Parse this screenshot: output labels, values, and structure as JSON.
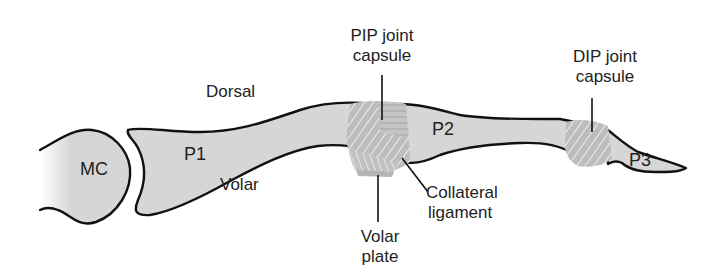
{
  "figure": {
    "colors": {
      "bone_fill": "#d6d6d6",
      "outline": "#111111",
      "ligament": "#bdbdbd",
      "ligament_stripe": "#eeeeee",
      "text": "#222222"
    }
  },
  "orientation": {
    "dorsal": "Dorsal",
    "volar": "Volar"
  },
  "bones": {
    "mc": "MC",
    "p1": "P1",
    "p2": "P2",
    "p3": "P3"
  },
  "callouts": {
    "pip_capsule": {
      "line1": "PIP joint",
      "line2": "capsule"
    },
    "dip_capsule": {
      "line1": "DIP joint",
      "line2": "capsule"
    },
    "collateral": {
      "line1": "Collateral",
      "line2": "ligament"
    },
    "volar_plate": {
      "line1": "Volar",
      "line2": "plate"
    }
  }
}
